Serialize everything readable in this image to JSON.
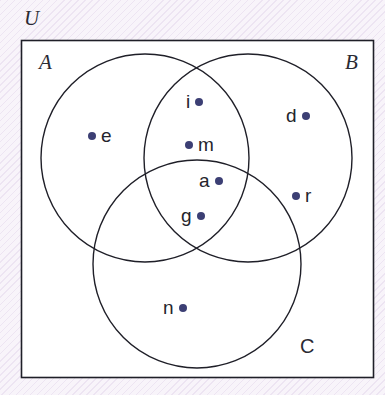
{
  "figure": {
    "kind": "venn-diagram",
    "universe_label": "U",
    "colors": {
      "background": "#f8f4fa",
      "stroke": "#1f1f28",
      "dot": "#3c3f74",
      "text": "#24242c"
    },
    "universe_box": {
      "x": 21,
      "y": 40,
      "width": 353,
      "height": 338
    },
    "sets": [
      {
        "id": "A",
        "label": "A",
        "style": "italic",
        "cx": 145,
        "cy": 158,
        "r": 104,
        "label_x": 39,
        "label_y": 52
      },
      {
        "id": "B",
        "label": "B",
        "style": "italic",
        "cx": 248,
        "cy": 158,
        "r": 104,
        "label_x": 345,
        "label_y": 52
      },
      {
        "id": "C",
        "label": "C",
        "style": "upright",
        "cx": 197,
        "cy": 264,
        "r": 104,
        "label_x": 300,
        "label_y": 336
      }
    ],
    "elements": [
      {
        "name": "e",
        "x": 88,
        "y": 126,
        "dot_side": "left",
        "region": "A only"
      },
      {
        "name": "i",
        "x": 186,
        "y": 92,
        "dot_side": "right",
        "region": "A and B"
      },
      {
        "name": "m",
        "x": 185,
        "y": 135,
        "dot_side": "left",
        "region": "A and B"
      },
      {
        "name": "a",
        "x": 199,
        "y": 171,
        "dot_side": "right",
        "region": "A and B and C"
      },
      {
        "name": "g",
        "x": 181,
        "y": 206,
        "dot_side": "right",
        "region": "A and B and C"
      },
      {
        "name": "d",
        "x": 286,
        "y": 106,
        "dot_side": "right",
        "region": "B only"
      },
      {
        "name": "r",
        "x": 292,
        "y": 186,
        "dot_side": "left",
        "region": "B only"
      },
      {
        "name": "n",
        "x": 163,
        "y": 298,
        "dot_side": "right",
        "region": "C only"
      }
    ]
  },
  "chart_data": {
    "type": "diagram",
    "title": "",
    "diagram_type": "three-set Venn diagram",
    "universe": "U",
    "set_names": [
      "A",
      "B",
      "C"
    ],
    "members": {
      "A_only": [
        "e"
      ],
      "B_only": [
        "d",
        "r"
      ],
      "C_only": [
        "n"
      ],
      "A_and_B_only": [
        "i",
        "m"
      ],
      "A_and_C_only": [],
      "B_and_C_only": [],
      "A_and_B_and_C": [
        "a",
        "g"
      ],
      "outside_all_sets": []
    },
    "all_labeled_points": [
      "e",
      "i",
      "m",
      "a",
      "g",
      "d",
      "r",
      "n"
    ],
    "point_count": 8
  }
}
